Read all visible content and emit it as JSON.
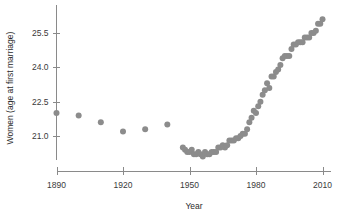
{
  "chart_data": {
    "type": "scatter",
    "title": "",
    "xlabel": "Year",
    "ylabel": "Women (age at first marriage)",
    "xlim": [
      1883,
      2016
    ],
    "ylim": [
      20.1,
      26.35
    ],
    "xticks": [
      1890,
      1920,
      1950,
      1980,
      2010
    ],
    "xtick_labels": [
      "1890",
      "1920",
      "1950",
      "1980",
      "2010"
    ],
    "yticks": [
      21.0,
      22.5,
      24.0,
      25.5
    ],
    "ytick_labels": [
      "21.0",
      "22.5",
      "24.0",
      "25.5"
    ],
    "grid": false,
    "legend": false,
    "marker_color": "#8c8c8c",
    "marker_size": 3.0,
    "axis_color": "#8a8a8a",
    "series": [
      {
        "name": "Median age at first marriage, women (US)",
        "x": [
          1890,
          1900,
          1910,
          1920,
          1930,
          1940,
          1947,
          1948,
          1949,
          1950,
          1951,
          1952,
          1953,
          1954,
          1955,
          1956,
          1957,
          1958,
          1959,
          1960,
          1961,
          1962,
          1963,
          1964,
          1965,
          1966,
          1967,
          1968,
          1969,
          1970,
          1971,
          1972,
          1973,
          1974,
          1975,
          1976,
          1977,
          1978,
          1979,
          1980,
          1981,
          1982,
          1983,
          1984,
          1985,
          1986,
          1987,
          1988,
          1989,
          1990,
          1991,
          1992,
          1993,
          1994,
          1995,
          1996,
          1997,
          1998,
          1999,
          2000,
          2001,
          2002,
          2003,
          2004,
          2005,
          2006,
          2007,
          2008,
          2009,
          2010
        ],
        "y": [
          22.0,
          21.9,
          21.6,
          21.2,
          21.3,
          21.5,
          20.5,
          20.4,
          20.3,
          20.3,
          20.4,
          20.2,
          20.2,
          20.3,
          20.2,
          20.1,
          20.3,
          20.2,
          20.2,
          20.3,
          20.3,
          20.3,
          20.5,
          20.5,
          20.6,
          20.5,
          20.6,
          20.8,
          20.8,
          20.8,
          20.9,
          20.9,
          21.0,
          21.1,
          21.1,
          21.3,
          21.6,
          21.8,
          22.1,
          22.0,
          22.3,
          22.5,
          22.8,
          23.0,
          23.3,
          23.1,
          23.6,
          23.6,
          23.8,
          23.9,
          24.1,
          24.4,
          24.5,
          24.5,
          24.5,
          24.8,
          25.0,
          25.0,
          25.1,
          25.1,
          25.1,
          25.3,
          25.3,
          25.3,
          25.5,
          25.5,
          25.6,
          25.9,
          25.9,
          26.1
        ]
      }
    ]
  },
  "axes": {
    "x_title": "Year",
    "y_title": "Women (age at first marriage)"
  }
}
